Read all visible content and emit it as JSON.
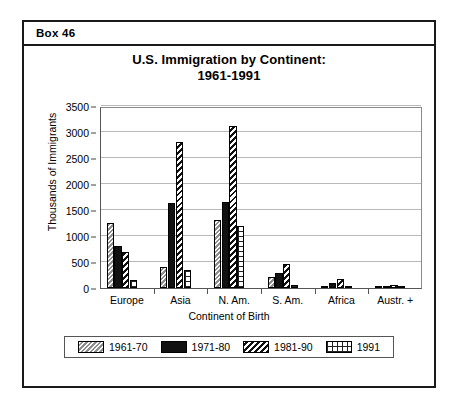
{
  "box": {
    "header_label": "Box 46"
  },
  "chart_data": {
    "type": "bar",
    "title": "U.S. Immigration by Continent:",
    "subtitle": "1961-1991",
    "xlabel": "Continent of Birth",
    "ylabel": "Thousands of Immigrants",
    "ylim": [
      0,
      3500
    ],
    "ytick_values": [
      0,
      500,
      1000,
      1500,
      2000,
      2500,
      3000,
      3500
    ],
    "ytick_labels": [
      "0",
      "500",
      "1000",
      "1500",
      "2000",
      "2500",
      "3000",
      "3500"
    ],
    "grid": true,
    "legend_position": "bottom",
    "categories": [
      "Europe",
      "Asia",
      "N. Am.",
      "S. Am.",
      "Africa",
      "Austr. +"
    ],
    "series": [
      {
        "name": "1961-70",
        "values": [
          1250,
          400,
          1300,
          220,
          40,
          30
        ]
      },
      {
        "name": "1971-80",
        "values": [
          800,
          1630,
          1650,
          280,
          90,
          40
        ]
      },
      {
        "name": "1981-90",
        "values": [
          700,
          2800,
          3120,
          460,
          180,
          50
        ]
      },
      {
        "name": "1991",
        "values": [
          150,
          350,
          1200,
          60,
          35,
          20
        ]
      }
    ]
  }
}
